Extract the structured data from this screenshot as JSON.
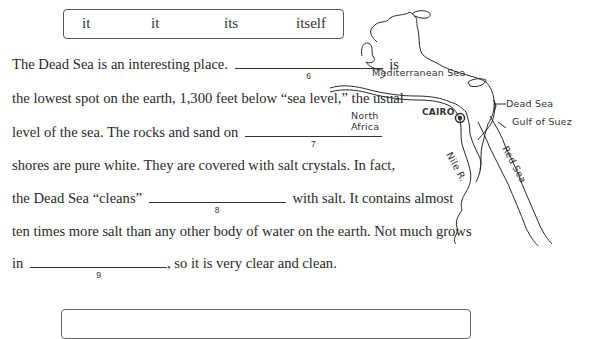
{
  "word_bank": {
    "words": [
      "it",
      "it",
      "its",
      "itself"
    ]
  },
  "passage": {
    "lines": [
      {
        "before": "The Dead Sea is an interesting place.",
        "blank": "6",
        "after": "is"
      },
      {
        "text": "the lowest spot on the earth, 1,300 feet below “sea level,” the usual"
      },
      {
        "before": "level of the sea. The rocks and sand on",
        "blank": "7",
        "after": ""
      },
      {
        "text": "shores are pure white. They are covered with salt crystals. In fact,"
      },
      {
        "before": "the Dead Sea “cleans”",
        "blank": "8",
        "after": "with salt. It contains almost"
      },
      {
        "text": "ten times more salt than any other body of water on the earth. Not much grows"
      },
      {
        "before": "in",
        "blank": "9",
        "after": ", so it is very clear and clean."
      }
    ]
  },
  "map": {
    "labels": {
      "mediterranean": "Mediterranean Sea",
      "dead_sea": "Dead Sea",
      "gulf_of_suez": "Gulf of Suez",
      "north_africa_1": "North",
      "north_africa_2": "Africa",
      "cairo": "CAIRO",
      "nile": "Nile R.",
      "red_sea": "Red Sea"
    }
  }
}
